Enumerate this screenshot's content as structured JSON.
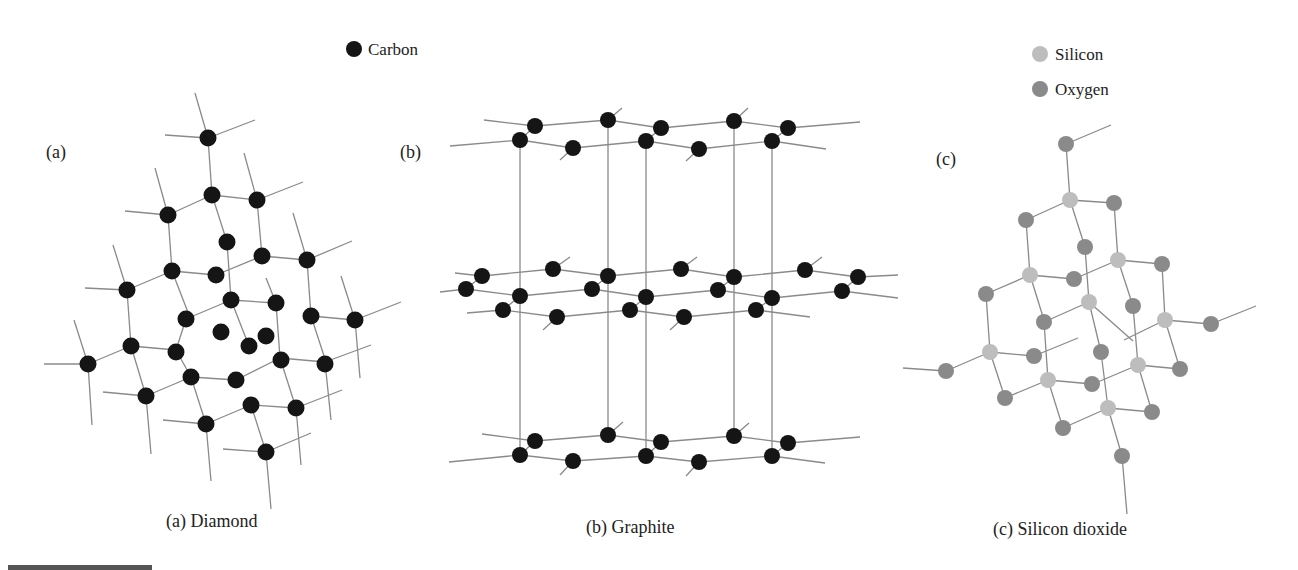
{
  "legend": {
    "carbon": {
      "label": "Carbon",
      "color": "#151515"
    },
    "silicon": {
      "label": "Silicon",
      "color": "#bdbdbd"
    },
    "oxygen": {
      "label": "Oxygen",
      "color": "#8a8a8a"
    }
  },
  "panels": [
    {
      "tag": "(a)",
      "caption": "(a) Diamond"
    },
    {
      "tag": "(b)",
      "caption": "(b) Graphite"
    },
    {
      "tag": "(c)",
      "caption": "(c) Silicon dioxide"
    }
  ]
}
